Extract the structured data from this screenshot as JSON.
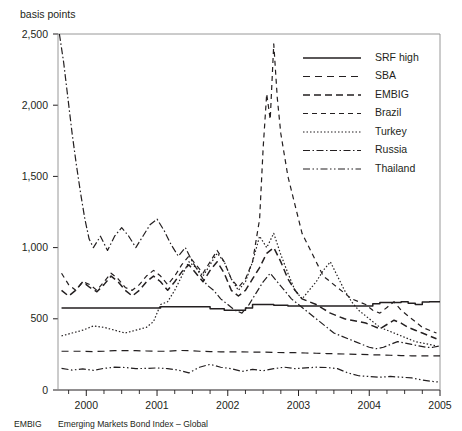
{
  "chart_data": {
    "type": "line",
    "title": "",
    "subtitle": "",
    "ylabel": "basis points",
    "xlabel": "",
    "ylim": [
      0,
      2500
    ],
    "yticks": [
      0,
      500,
      1000,
      1500,
      2000,
      2500
    ],
    "ytick_labels": [
      "0",
      "500",
      "1,000",
      "1,500",
      "2,000",
      "2,500"
    ],
    "xlim": [
      1999.6,
      2005.0
    ],
    "xticks": [
      2000,
      2001,
      2002,
      2003,
      2004,
      2005
    ],
    "xtick_labels": [
      "2000",
      "2001",
      "2002",
      "2003",
      "2004",
      "2005"
    ],
    "minor_xticks": [
      1999.75,
      2000.25,
      2000.5,
      2000.75,
      2001.25,
      2001.5,
      2001.75,
      2002.25,
      2002.5,
      2002.75,
      2003.25,
      2003.5,
      2003.75,
      2004.25,
      2004.5,
      2004.75
    ],
    "grid": false,
    "legend_position": "top-right",
    "series": [
      {
        "name": "SRF high",
        "style": "solid",
        "x": [
          1999.65,
          1999.75,
          1999.85,
          1999.95,
          2000.05,
          2000.15,
          2000.25,
          2000.35,
          2000.45,
          2000.55,
          2000.65,
          2000.75,
          2000.85,
          2000.95,
          2001.05,
          2001.15,
          2001.25,
          2001.35,
          2001.45,
          2001.55,
          2001.65,
          2001.75,
          2001.85,
          2001.95,
          2002.05,
          2002.15,
          2002.25,
          2002.35,
          2002.45,
          2002.55,
          2002.65,
          2002.75,
          2002.85,
          2002.95,
          2003.05,
          2003.15,
          2003.25,
          2003.35,
          2003.45,
          2003.55,
          2003.65,
          2003.75,
          2003.85,
          2003.95,
          2004.05,
          2004.15,
          2004.25,
          2004.35,
          2004.45,
          2004.55,
          2004.65,
          2004.75,
          2004.85,
          2004.95
        ],
        "values": [
          575,
          575,
          575,
          575,
          575,
          575,
          575,
          575,
          575,
          575,
          575,
          575,
          575,
          575,
          585,
          585,
          585,
          585,
          585,
          585,
          585,
          570,
          570,
          560,
          560,
          560,
          575,
          600,
          600,
          600,
          595,
          595,
          590,
          590,
          590,
          590,
          590,
          590,
          590,
          590,
          590,
          590,
          590,
          590,
          605,
          615,
          615,
          615,
          620,
          610,
          600,
          618,
          620,
          620
        ]
      },
      {
        "name": "SBA",
        "style": "dashed-light",
        "x": [
          1999.65,
          1999.8,
          1999.95,
          2000.1,
          2000.25,
          2000.4,
          2000.55,
          2000.7,
          2000.85,
          2001.0,
          2001.15,
          2001.3,
          2001.45,
          2001.6,
          2001.75,
          2001.9,
          2002.05,
          2002.2,
          2002.35,
          2002.5,
          2002.65,
          2002.8,
          2002.95,
          2003.1,
          2003.25,
          2003.4,
          2003.55,
          2003.7,
          2003.85,
          2004.0,
          2004.15,
          2004.3,
          2004.45,
          2004.6,
          2004.75,
          2004.9,
          2005.0
        ],
        "values": [
          272,
          272,
          272,
          270,
          272,
          276,
          276,
          276,
          274,
          272,
          272,
          278,
          276,
          272,
          270,
          268,
          268,
          268,
          266,
          266,
          264,
          262,
          262,
          260,
          258,
          256,
          254,
          252,
          250,
          248,
          246,
          244,
          242,
          240,
          240,
          240,
          240
        ]
      },
      {
        "name": "EMBIG",
        "style": "dashed-bold",
        "x": [
          1999.65,
          1999.75,
          1999.85,
          1999.95,
          2000.05,
          2000.15,
          2000.25,
          2000.35,
          2000.45,
          2000.55,
          2000.65,
          2000.75,
          2000.85,
          2000.95,
          2001.05,
          2001.15,
          2001.25,
          2001.35,
          2001.45,
          2001.55,
          2001.65,
          2001.75,
          2001.85,
          2001.95,
          2002.05,
          2002.15,
          2002.25,
          2002.35,
          2002.45,
          2002.55,
          2002.65,
          2002.75,
          2002.85,
          2002.95,
          2003.05,
          2003.15,
          2003.25,
          2003.35,
          2003.45,
          2003.55,
          2003.65,
          2003.75,
          2003.85,
          2003.95,
          2004.05,
          2004.15,
          2004.25,
          2004.35,
          2004.45,
          2004.55,
          2004.65,
          2004.75,
          2004.85,
          2004.95
        ],
        "values": [
          700,
          660,
          700,
          760,
          720,
          690,
          740,
          800,
          760,
          700,
          660,
          700,
          760,
          800,
          760,
          700,
          760,
          830,
          880,
          820,
          760,
          840,
          900,
          820,
          700,
          660,
          700,
          780,
          860,
          960,
          1000,
          900,
          780,
          700,
          640,
          620,
          600,
          570,
          540,
          520,
          500,
          490,
          480,
          470,
          450,
          430,
          460,
          490,
          470,
          440,
          420,
          400,
          380,
          360
        ]
      },
      {
        "name": "Brazil",
        "style": "dashed-medium",
        "x": [
          1999.65,
          1999.75,
          1999.85,
          1999.95,
          2000.05,
          2000.15,
          2000.25,
          2000.35,
          2000.45,
          2000.55,
          2000.65,
          2000.75,
          2000.85,
          2000.95,
          2001.05,
          2001.15,
          2001.25,
          2001.35,
          2001.45,
          2001.55,
          2001.65,
          2001.75,
          2001.85,
          2001.95,
          2002.05,
          2002.15,
          2002.25,
          2002.35,
          2002.45,
          2002.5,
          2002.55,
          2002.6,
          2002.65,
          2002.7,
          2002.75,
          2002.85,
          2002.95,
          2003.05,
          2003.15,
          2003.25,
          2003.35,
          2003.45,
          2003.55,
          2003.65,
          2003.75,
          2003.85,
          2003.95,
          2004.05,
          2004.15,
          2004.25,
          2004.35,
          2004.45,
          2004.55,
          2004.65,
          2004.75,
          2004.85,
          2004.95
        ],
        "values": [
          820,
          740,
          700,
          760,
          740,
          700,
          760,
          820,
          780,
          720,
          700,
          740,
          800,
          840,
          800,
          740,
          800,
          880,
          940,
          880,
          820,
          900,
          980,
          900,
          780,
          720,
          780,
          900,
          1200,
          1700,
          2080,
          1900,
          2430,
          2050,
          1800,
          1500,
          1300,
          1100,
          1000,
          900,
          800,
          760,
          720,
          680,
          640,
          620,
          600,
          560,
          540,
          580,
          620,
          560,
          520,
          480,
          440,
          420,
          400
        ]
      },
      {
        "name": "Turkey",
        "style": "dotted",
        "x": [
          1999.65,
          1999.8,
          1999.95,
          2000.1,
          2000.25,
          2000.4,
          2000.55,
          2000.7,
          2000.85,
          2000.95,
          2001.05,
          2001.15,
          2001.25,
          2001.35,
          2001.45,
          2001.55,
          2001.65,
          2001.75,
          2001.85,
          2001.95,
          2002.05,
          2002.15,
          2002.25,
          2002.35,
          2002.45,
          2002.55,
          2002.65,
          2002.75,
          2002.85,
          2002.95,
          2003.05,
          2003.15,
          2003.25,
          2003.35,
          2003.45,
          2003.55,
          2003.65,
          2003.75,
          2003.85,
          2003.95,
          2004.05,
          2004.15,
          2004.25,
          2004.35,
          2004.45,
          2004.55,
          2004.65,
          2004.75,
          2004.85,
          2004.95
        ],
        "values": [
          380,
          400,
          420,
          450,
          440,
          420,
          400,
          420,
          440,
          480,
          600,
          620,
          700,
          800,
          900,
          860,
          800,
          880,
          960,
          900,
          780,
          700,
          760,
          900,
          1080,
          1000,
          1100,
          950,
          820,
          700,
          640,
          700,
          760,
          840,
          900,
          800,
          700,
          620,
          560,
          520,
          480,
          440,
          420,
          400,
          380,
          360,
          340,
          330,
          320,
          310
        ]
      },
      {
        "name": "Russia",
        "style": "dash-dot",
        "x": [
          1999.62,
          1999.68,
          1999.74,
          1999.8,
          1999.86,
          1999.92,
          1999.98,
          2000.04,
          2000.1,
          2000.2,
          2000.3,
          2000.4,
          2000.5,
          2000.6,
          2000.7,
          2000.8,
          2000.9,
          2001.0,
          2001.1,
          2001.2,
          2001.3,
          2001.4,
          2001.5,
          2001.6,
          2001.7,
          2001.8,
          2001.9,
          2002.0,
          2002.1,
          2002.2,
          2002.3,
          2002.4,
          2002.5,
          2002.6,
          2002.7,
          2002.8,
          2002.9,
          2003.0,
          2003.1,
          2003.2,
          2003.3,
          2003.4,
          2003.5,
          2003.6,
          2003.7,
          2003.8,
          2003.9,
          2004.0,
          2004.1,
          2004.2,
          2004.3,
          2004.4,
          2004.5,
          2004.6,
          2004.7,
          2004.8,
          2004.9,
          2005.0
        ],
        "values": [
          2500,
          2300,
          2050,
          1800,
          1580,
          1380,
          1200,
          1060,
          1000,
          1080,
          980,
          1080,
          1140,
          1080,
          1000,
          1080,
          1160,
          1200,
          1120,
          1020,
          940,
          1000,
          900,
          820,
          740,
          700,
          640,
          600,
          560,
          540,
          600,
          680,
          760,
          820,
          760,
          700,
          640,
          600,
          560,
          520,
          480,
          440,
          400,
          380,
          360,
          340,
          320,
          300,
          290,
          300,
          320,
          340,
          330,
          320,
          310,
          300,
          300,
          310
        ]
      },
      {
        "name": "Thailand",
        "style": "dash-dot-dot",
        "x": [
          1999.65,
          1999.8,
          1999.95,
          2000.1,
          2000.25,
          2000.4,
          2000.55,
          2000.7,
          2000.85,
          2001.0,
          2001.15,
          2001.3,
          2001.45,
          2001.6,
          2001.75,
          2001.9,
          2002.05,
          2002.2,
          2002.35,
          2002.5,
          2002.65,
          2002.8,
          2002.95,
          2003.1,
          2003.25,
          2003.4,
          2003.55,
          2003.7,
          2003.85,
          2004.0,
          2004.15,
          2004.3,
          2004.45,
          2004.6,
          2004.75,
          2004.9,
          2005.0
        ],
        "values": [
          152,
          140,
          148,
          138,
          152,
          160,
          158,
          150,
          152,
          155,
          150,
          140,
          120,
          160,
          180,
          160,
          150,
          130,
          145,
          135,
          150,
          160,
          150,
          155,
          160,
          158,
          150,
          120,
          100,
          95,
          90,
          95,
          90,
          85,
          70,
          60,
          55
        ]
      }
    ]
  },
  "footnote": {
    "abbr": "EMBIG",
    "equals": "=",
    "expansion": "Emerging Markets Bond Index – Global"
  }
}
